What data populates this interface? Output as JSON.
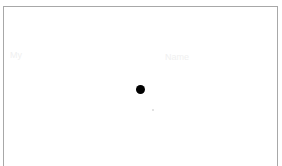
{
  "panel": {
    "border_color": "#a8a8a8",
    "background": "#ffffff"
  },
  "ghost_labels": {
    "left": "My",
    "center": "Name"
  },
  "markers": {
    "primary_dot": {
      "color": "#000000",
      "x": 141,
      "y": 90
    },
    "secondary_dot": {
      "color": "#d8d8d8",
      "x": 153,
      "y": 110
    }
  }
}
